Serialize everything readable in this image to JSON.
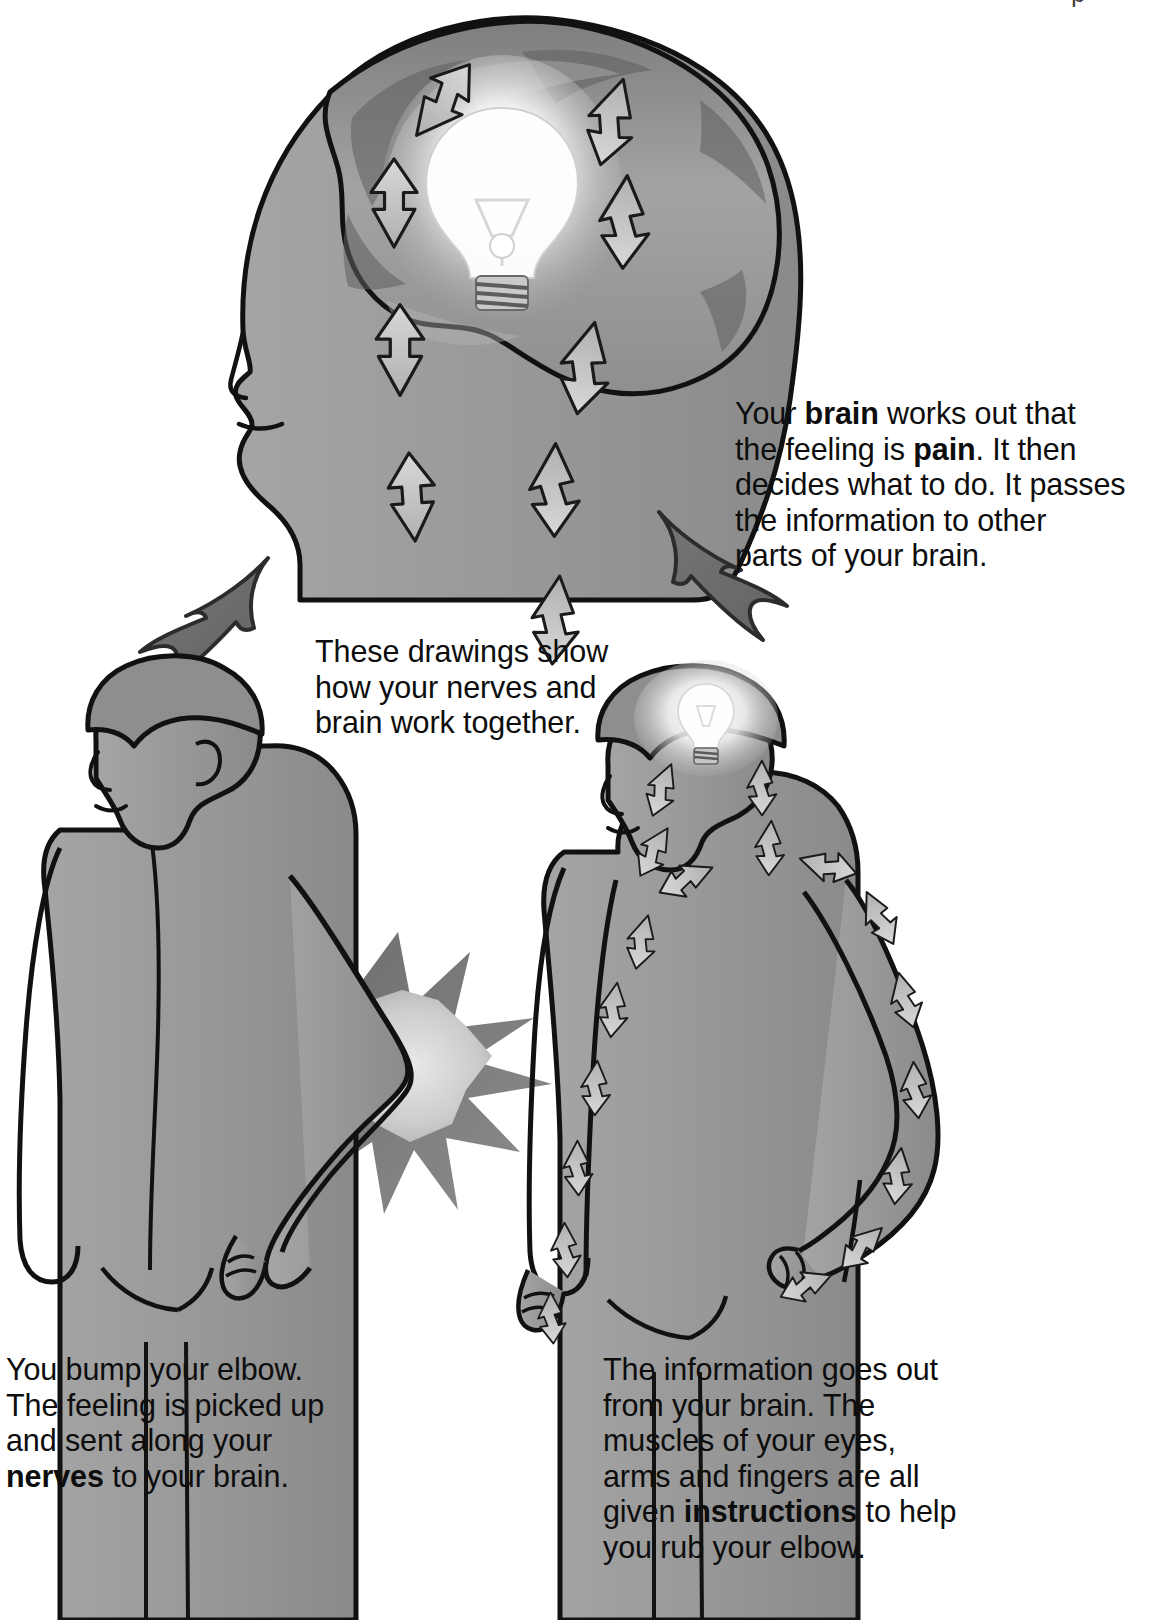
{
  "page": {
    "width": 1165,
    "height": 1620,
    "background": "#ffffff",
    "top_crop_mark": "p"
  },
  "palette": {
    "skin": "#9a9a9a",
    "skin_dark": "#7d7d7d",
    "skin_light": "#b0b0b0",
    "hair": "#8c8c8c",
    "brain": "#9d9d9d",
    "brain_shadow": "#5e5e5e",
    "arrow_fill": "#b9b9b9",
    "arrow_fill_light": "#d2d2d2",
    "big_arrow": "#6e6e6e",
    "outline": "#111111",
    "starburst": "#6f6f6f",
    "starburst_core": "#cfcfcf",
    "bulb_glow": "#ffffff",
    "text": "#0d0d0d"
  },
  "captions": [
    {
      "id": "cap-brain",
      "name": "caption-brain-decides",
      "lines": [
        "Your <b>brain</b> works out that",
        "the feeling is <b>pain</b>. It then",
        "decides what to do. It passes",
        "the information to other",
        "parts of your brain."
      ],
      "plain": "Your brain works out that the feeling is pain. It then decides what to do. It passes the information to other parts of your brain.",
      "bold_terms": [
        "brain",
        "pain"
      ]
    },
    {
      "id": "cap-intro",
      "name": "caption-these-drawings",
      "lines": [
        "These drawings show",
        "how your nerves and",
        "brain work together."
      ],
      "plain": "These drawings show how your nerves and brain work together.",
      "bold_terms": []
    },
    {
      "id": "cap-bump",
      "name": "caption-bump-elbow",
      "lines": [
        "You bump your elbow.",
        "The feeling is picked up",
        "and sent along your",
        "<b>nerves</b> to your brain."
      ],
      "plain": "You bump your elbow. The feeling is picked up and sent along your nerves to your brain.",
      "bold_terms": [
        "nerves"
      ]
    },
    {
      "id": "cap-out",
      "name": "caption-information-out",
      "lines": [
        "The information goes out",
        "from your brain. The",
        "muscles of your eyes,",
        "arms and fingers are all",
        "given <b>instructions</b> to help",
        "you rub your elbow."
      ],
      "plain": "The information goes out from your brain. The muscles of your eyes, arms and fingers are all given instructions to help you rub your elbow.",
      "bold_terms": [
        "instructions"
      ]
    }
  ],
  "illustrations": [
    {
      "name": "head-with-brain",
      "description": "Large profile head facing left with exposed brain containing a glowing lightbulb and eight arrows; arrows on the left point up (incoming signals), arrows on the right point down (outgoing signals).",
      "icon": "head-brain-bulb-icon",
      "arrows_up": 4,
      "arrows_down": 5,
      "bulb": "lightbulb-icon"
    },
    {
      "name": "boy-bumping-elbow",
      "description": "Boy seen from behind, left of page, with a starburst flash at his right elbow showing the bump.",
      "icon": "boy-elbow-bump-icon"
    },
    {
      "name": "boy-signals-out",
      "description": "Boy seen from behind, right of page, glowing lightbulb at head, arrows streaming down both arms to the hands.",
      "icon": "boy-signals-out-icon"
    },
    {
      "name": "arrow-up-to-head",
      "description": "Thick dark curved arrow rising from the left boy up to the large head.",
      "icon": "curved-arrow-up-icon"
    },
    {
      "name": "arrow-down-to-boy",
      "description": "Thick dark curved arrow descending from the large head to the right boy.",
      "icon": "curved-arrow-down-icon"
    }
  ]
}
